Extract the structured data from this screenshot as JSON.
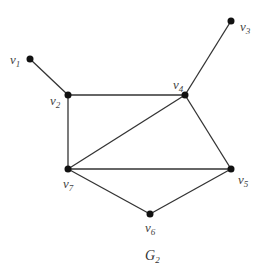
{
  "diagram": {
    "caption": {
      "main": "G",
      "sub": "2"
    },
    "colors": {
      "edge": "#333333",
      "node": "#111111",
      "label": "#444444",
      "background": "#ffffff"
    },
    "nodes": [
      {
        "id": "v1",
        "main": "v",
        "sub": "1",
        "x": 30,
        "y": 59
      },
      {
        "id": "v2",
        "main": "v",
        "sub": "2",
        "x": 68,
        "y": 95
      },
      {
        "id": "v3",
        "main": "v",
        "sub": "3",
        "x": 231,
        "y": 21
      },
      {
        "id": "v4",
        "main": "v",
        "sub": "4",
        "x": 185,
        "y": 95
      },
      {
        "id": "v5",
        "main": "v",
        "sub": "5",
        "x": 231,
        "y": 169
      },
      {
        "id": "v6",
        "main": "v",
        "sub": "6",
        "x": 150,
        "y": 214
      },
      {
        "id": "v7",
        "main": "v",
        "sub": "7",
        "x": 68,
        "y": 169
      }
    ],
    "edges": [
      [
        "v1",
        "v2"
      ],
      [
        "v2",
        "v4"
      ],
      [
        "v2",
        "v7"
      ],
      [
        "v3",
        "v4"
      ],
      [
        "v4",
        "v7"
      ],
      [
        "v4",
        "v5"
      ],
      [
        "v7",
        "v5"
      ],
      [
        "v7",
        "v6"
      ],
      [
        "v6",
        "v5"
      ]
    ]
  }
}
